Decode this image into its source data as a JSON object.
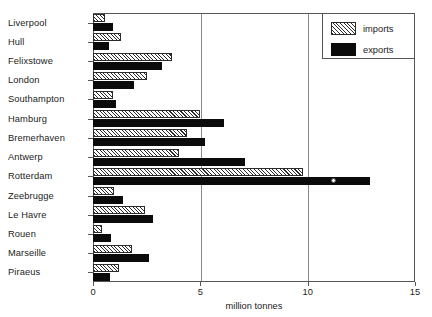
{
  "chart_data": {
    "type": "bar",
    "orientation": "horizontal",
    "title": "",
    "subtitle": "",
    "xlabel": "million tonnes",
    "ylabel": "",
    "xlim": [
      0,
      15
    ],
    "xticks": [
      0,
      5,
      10,
      15
    ],
    "xtick_labels": [
      "0",
      "5",
      "10",
      "15"
    ],
    "grid": true,
    "grid_axis": "x",
    "legend_position": "top-right",
    "categories": [
      "Liverpool",
      "Hull",
      "Felixstowe",
      "London",
      "Southampton",
      "Hamburg",
      "Bremerhaven",
      "Antwerp",
      "Rotterdam",
      "Zeebrugge",
      "Le Havre",
      "Rouen",
      "Marseille",
      "Piraeus"
    ],
    "series": [
      {
        "name": "imports",
        "fill": "hatched",
        "values": [
          0.55,
          1.3,
          3.7,
          2.5,
          0.95,
          5.0,
          4.4,
          4.0,
          9.8,
          1.0,
          2.4,
          0.4,
          1.8,
          1.2
        ]
      },
      {
        "name": "exports",
        "fill": "solid-black",
        "values": [
          0.95,
          0.75,
          3.2,
          1.9,
          1.05,
          6.1,
          5.2,
          7.1,
          12.9,
          1.4,
          2.8,
          0.85,
          2.6,
          0.8
        ]
      }
    ],
    "annotations": [
      {
        "name": "rotterdam-exports-marker",
        "marker": "open-circle",
        "category": "Rotterdam",
        "series": "exports",
        "x": 11.2
      }
    ]
  },
  "legend": {
    "entries": [
      {
        "label": "imports",
        "swatch": "hatched"
      },
      {
        "label": "exports",
        "swatch": "solid-black"
      }
    ]
  },
  "axis": {
    "x_title": "million tonnes"
  },
  "colors": {
    "bar_exports": "#0b0b0b",
    "bar_imports_outline": "#2b2b2b",
    "axis": "#555555",
    "grid": "#8a8a8a",
    "text": "#1c1c1c",
    "background": "#ffffff"
  }
}
